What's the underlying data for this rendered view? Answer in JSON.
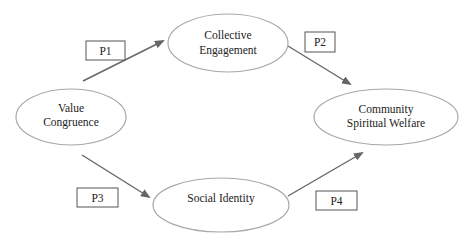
{
  "diagram": {
    "nodes": [
      {
        "id": "value_congruence",
        "lines": [
          "Value",
          "Congruence"
        ]
      },
      {
        "id": "collective_engagement",
        "lines": [
          "Collective",
          "Engagement"
        ]
      },
      {
        "id": "community_spiritual_welfare",
        "lines": [
          "Community",
          "Spiritual Welfare"
        ]
      },
      {
        "id": "social_identity",
        "lines": [
          "Social Identity"
        ]
      }
    ],
    "edges": [
      {
        "from": "value_congruence",
        "to": "collective_engagement",
        "label": "P1"
      },
      {
        "from": "collective_engagement",
        "to": "community_spiritual_welfare",
        "label": "P2"
      },
      {
        "from": "value_congruence",
        "to": "social_identity",
        "label": "P3"
      },
      {
        "from": "social_identity",
        "to": "community_spiritual_welfare",
        "label": "P4"
      }
    ],
    "colors": {
      "ellipse_stroke": "#a8a8a8",
      "arrow": "#666666",
      "box_stroke": "#555555",
      "text": "#222222"
    }
  }
}
